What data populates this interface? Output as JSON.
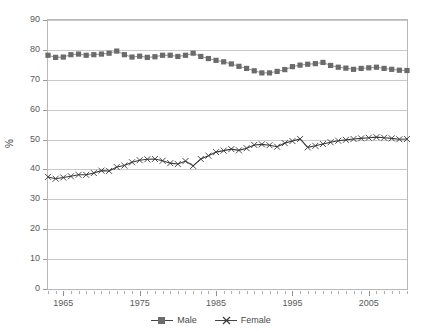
{
  "chart_data": {
    "type": "line",
    "title": "",
    "subtitle": "",
    "xlabel": "",
    "ylabel": "%",
    "ylim": [
      0,
      90
    ],
    "ytick_step": 10,
    "yticks": [
      0,
      10,
      20,
      30,
      40,
      50,
      60,
      70,
      80,
      90
    ],
    "xlim": [
      1963,
      2010
    ],
    "xticks_major": [
      1965,
      1975,
      1985,
      1995,
      2005
    ],
    "xtick_labels": [
      "1965",
      "1975",
      "1985",
      "1995",
      "2005"
    ],
    "xticks_minor_step": 1,
    "grid": "horizontal",
    "legend_position": "bottom-center",
    "x": [
      1963,
      1964,
      1965,
      1966,
      1967,
      1968,
      1969,
      1970,
      1971,
      1972,
      1973,
      1974,
      1975,
      1976,
      1977,
      1978,
      1979,
      1980,
      1981,
      1982,
      1983,
      1984,
      1985,
      1986,
      1987,
      1988,
      1989,
      1990,
      1991,
      1992,
      1993,
      1994,
      1995,
      1996,
      1997,
      1998,
      1999,
      2000,
      2001,
      2002,
      2003,
      2004,
      2005,
      2006,
      2007,
      2008,
      2009,
      2010
    ],
    "series": [
      {
        "name": "Male",
        "marker": "square",
        "color": "#6b6b6b",
        "line_color": "#8a8a8a",
        "values": [
          78.2,
          77.5,
          77.6,
          78.4,
          78.6,
          78.2,
          78.4,
          78.6,
          78.9,
          79.6,
          78.4,
          77.6,
          77.9,
          77.5,
          77.7,
          78.2,
          78.2,
          77.8,
          78.2,
          78.9,
          77.8,
          77.1,
          76.5,
          76.0,
          75.3,
          74.5,
          73.8,
          73.0,
          72.3,
          72.3,
          72.8,
          73.4,
          74.4,
          74.9,
          75.2,
          75.4,
          75.8,
          74.8,
          74.2,
          73.9,
          73.5,
          73.8,
          74.0,
          74.2,
          73.8,
          73.5,
          73.2,
          73.1
        ]
      },
      {
        "name": "Female",
        "marker": "x",
        "color": "#3a3a3a",
        "line_color": "#3a3a3a",
        "values": [
          37.5,
          36.9,
          37.3,
          37.7,
          38.2,
          38.2,
          38.8,
          39.6,
          39.5,
          40.8,
          41.3,
          42.4,
          43.1,
          43.4,
          43.5,
          42.9,
          42.1,
          41.8,
          42.8,
          41.2,
          43.5,
          44.6,
          45.8,
          46.3,
          46.8,
          46.4,
          47.1,
          48.2,
          48.4,
          48.1,
          47.6,
          48.8,
          49.5,
          50.2,
          47.4,
          47.9,
          48.5,
          49.1,
          49.6,
          49.9,
          50.2,
          50.4,
          50.6,
          50.8,
          50.6,
          50.4,
          50.1,
          50.2
        ]
      }
    ]
  },
  "legend": {
    "items": [
      {
        "label": "Male"
      },
      {
        "label": "Female"
      }
    ]
  },
  "axes": {
    "y_title": "%"
  }
}
